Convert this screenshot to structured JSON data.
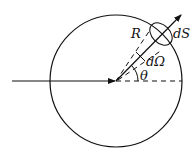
{
  "diagram": {
    "labels": {
      "radius": "R",
      "surface_element": "dS",
      "solid_angle": "dΩ",
      "angle": "θ"
    },
    "colors": {
      "stroke": "#111111",
      "background": "#ffffff"
    }
  }
}
